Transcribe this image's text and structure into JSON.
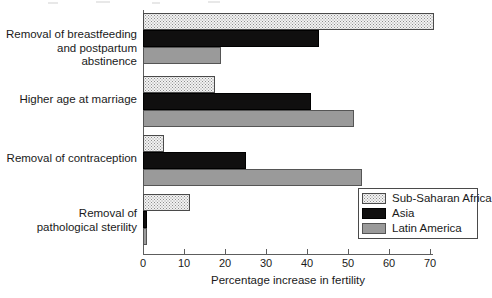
{
  "chart_data": {
    "type": "bar",
    "orientation": "horizontal",
    "title": "",
    "subtitle": "",
    "xlabel": "Percentage increase in fertility",
    "ylabel": "",
    "xlim": [
      0,
      73
    ],
    "xticks": [
      0,
      10,
      20,
      30,
      40,
      50,
      60,
      70
    ],
    "xtick_labels": [
      "0",
      "10",
      "20",
      "30",
      "40",
      "50",
      "60",
      "70"
    ],
    "grid": false,
    "legend_position": "bottom-right",
    "categories": [
      "Removal of breastfeeding\nand postpartum abstinence",
      "Higher age at marriage",
      "Removal of contraception",
      "Removal of\npathological sterility"
    ],
    "series": [
      {
        "name": "Sub-Saharan Africa",
        "pattern": "dotted-stipple",
        "color": "#f2f2f2",
        "values": [
          71,
          17.5,
          5,
          11.5
        ]
      },
      {
        "name": "Asia",
        "pattern": "solid",
        "color": "#100f0f",
        "values": [
          43,
          41,
          25,
          1
        ]
      },
      {
        "name": "Latin America",
        "pattern": "solid",
        "color": "#9a9a9a",
        "values": [
          19,
          51.5,
          53.5,
          1
        ]
      }
    ]
  },
  "legend": {
    "entries": [
      {
        "label": "Sub-Saharan Africa"
      },
      {
        "label": "Asia"
      },
      {
        "label": "Latin America"
      }
    ]
  },
  "axis": {
    "x_title": "Percentage increase in fertility",
    "tick_0": "0",
    "tick_1": "10",
    "tick_2": "20",
    "tick_3": "30",
    "tick_4": "40",
    "tick_5": "50",
    "tick_6": "60",
    "tick_7": "70"
  },
  "categories": {
    "c0": "Removal of breastfeeding\nand postpartum abstinence",
    "c1": "Higher age at marriage",
    "c2": "Removal of contraception",
    "c3": "Removal of\npathological sterility"
  }
}
